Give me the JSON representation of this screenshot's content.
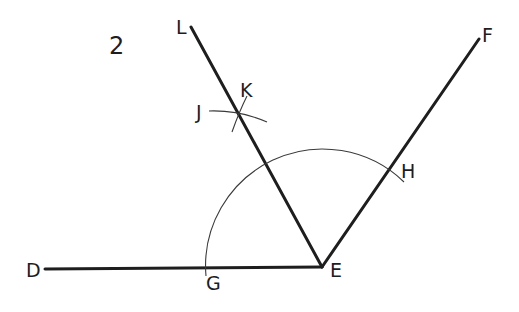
{
  "figure": {
    "number": "2",
    "colors": {
      "line": "#1e1e1e",
      "construction": "#3a3a3a",
      "background": "#ffffff"
    }
  },
  "points": {
    "D": {
      "label": "D"
    },
    "E": {
      "label": "E"
    },
    "F": {
      "label": "F"
    },
    "G": {
      "label": "G"
    },
    "H": {
      "label": "H"
    },
    "J": {
      "label": "J"
    },
    "K": {
      "label": "K"
    },
    "L": {
      "label": "L"
    }
  },
  "segments": [
    {
      "from": "D",
      "to": "E",
      "name": "ray-ED"
    },
    {
      "from": "E",
      "to": "F",
      "name": "ray-EF"
    },
    {
      "from": "E",
      "to": "L",
      "name": "ray-EL"
    }
  ],
  "arcs": [
    {
      "center": "E",
      "through": [
        "G",
        "H"
      ],
      "name": "arc-GH"
    },
    {
      "name": "arc-J"
    },
    {
      "name": "arc-K"
    }
  ]
}
